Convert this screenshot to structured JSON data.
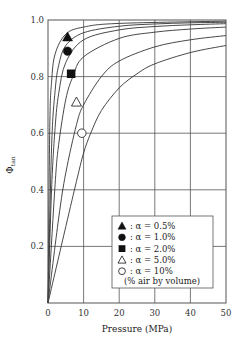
{
  "chart_data": {
    "type": "line",
    "title": "",
    "xlabel": "Pressure (MPa)",
    "ylabel": "Φ_tan",
    "ylabel_main": "Φ",
    "ylabel_sub": "tan",
    "xlim": [
      0,
      50
    ],
    "ylim": [
      0,
      1.0
    ],
    "x_ticks": [
      "0",
      "10",
      "20",
      "30",
      "40",
      "50"
    ],
    "y_ticks": [
      "0.2",
      "0.4",
      "0.6",
      "0.8",
      "1.0"
    ],
    "grid": true,
    "legend_position": "lower right (inside)",
    "series": [
      {
        "name": "α = 0.5%",
        "marker": "filled-triangle",
        "marker_point": {
          "x": 5.5,
          "y": 0.94
        },
        "curve": [
          [
            0,
            0
          ],
          [
            1,
            0.55
          ],
          [
            2,
            0.75
          ],
          [
            3,
            0.84
          ],
          [
            5,
            0.91
          ],
          [
            10,
            0.955
          ],
          [
            20,
            0.978
          ],
          [
            30,
            0.986
          ],
          [
            40,
            0.99
          ],
          [
            50,
            0.992
          ]
        ]
      },
      {
        "name": "α = 1.0%",
        "marker": "filled-circle",
        "marker_point": {
          "x": 5.5,
          "y": 0.89
        },
        "curve": [
          [
            0,
            0
          ],
          [
            1,
            0.4
          ],
          [
            2,
            0.62
          ],
          [
            3,
            0.74
          ],
          [
            5,
            0.85
          ],
          [
            10,
            0.93
          ],
          [
            20,
            0.965
          ],
          [
            30,
            0.977
          ],
          [
            40,
            0.983
          ],
          [
            50,
            0.987
          ]
        ]
      },
      {
        "name": "α = 2.0%",
        "marker": "filled-square",
        "marker_point": {
          "x": 6.5,
          "y": 0.81
        },
        "curve": [
          [
            0,
            0
          ],
          [
            2,
            0.42
          ],
          [
            3,
            0.56
          ],
          [
            5,
            0.72
          ],
          [
            7,
            0.8
          ],
          [
            10,
            0.87
          ],
          [
            20,
            0.935
          ],
          [
            30,
            0.957
          ],
          [
            40,
            0.968
          ],
          [
            50,
            0.975
          ]
        ]
      },
      {
        "name": "α = 5.0%",
        "marker": "open-triangle",
        "marker_point": {
          "x": 8,
          "y": 0.71
        },
        "curve": [
          [
            0,
            0
          ],
          [
            3,
            0.3
          ],
          [
            5,
            0.46
          ],
          [
            8,
            0.63
          ],
          [
            10,
            0.7
          ],
          [
            15,
            0.8
          ],
          [
            20,
            0.855
          ],
          [
            30,
            0.905
          ],
          [
            40,
            0.93
          ],
          [
            50,
            0.945
          ]
        ]
      },
      {
        "name": "α = 10%",
        "marker": "open-circle",
        "marker_point": {
          "x": 9.5,
          "y": 0.6
        },
        "curve": [
          [
            0,
            0
          ],
          [
            5,
            0.27
          ],
          [
            8,
            0.43
          ],
          [
            10,
            0.53
          ],
          [
            12,
            0.6
          ],
          [
            15,
            0.68
          ],
          [
            20,
            0.76
          ],
          [
            25,
            0.81
          ],
          [
            30,
            0.845
          ],
          [
            40,
            0.885
          ],
          [
            50,
            0.91
          ]
        ]
      },
      {
        "name": "unlabeled",
        "marker": "none",
        "curve": [
          [
            0,
            0
          ],
          [
            0.5,
            0.62
          ],
          [
            1,
            0.78
          ],
          [
            2,
            0.88
          ],
          [
            5,
            0.95
          ],
          [
            10,
            0.975
          ],
          [
            20,
            0.988
          ],
          [
            50,
            0.996
          ]
        ]
      }
    ],
    "legend": {
      "entries": [
        {
          "symbol": "▲",
          "label": ": α = 0.5%"
        },
        {
          "symbol": "●",
          "label": ": α = 1.0%"
        },
        {
          "symbol": "■",
          "label": ": α = 2.0%"
        },
        {
          "symbol": "△",
          "label": ": α = 5.0%"
        },
        {
          "symbol": "○",
          "label": ": α = 10%"
        }
      ],
      "note": "(% air by volume)"
    }
  }
}
